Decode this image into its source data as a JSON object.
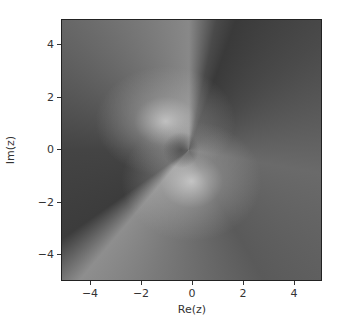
{
  "chart_data": {
    "type": "heatmap",
    "title": "",
    "xlabel": "Re(z)",
    "ylabel": "Im(z)",
    "xlim": [
      -5,
      5
    ],
    "ylim": [
      -5,
      5
    ],
    "x_ticks": [
      "-4",
      "-2",
      "0",
      "2",
      "4"
    ],
    "y_ticks": [
      "4",
      "2",
      "0",
      "-2",
      "-4"
    ],
    "colormap": "grayscale",
    "grid": false,
    "features": [
      {
        "description": "bright spot",
        "x": -0.8,
        "y": 0.8
      },
      {
        "description": "bright spot",
        "x": 0.0,
        "y": -0.8
      },
      {
        "description": "dark wedge toward upper-right"
      },
      {
        "description": "dark wedge toward lower-left"
      }
    ]
  },
  "axes": {
    "xlabel": "Re(z)",
    "ylabel": "Im(z)",
    "x_ticks": [
      {
        "label": "−4",
        "px": 90
      },
      {
        "label": "−2",
        "px": 141
      },
      {
        "label": "0",
        "px": 192
      },
      {
        "label": "2",
        "px": 243
      },
      {
        "label": "4",
        "px": 294
      }
    ],
    "y_ticks": [
      {
        "label": "4",
        "px": 44
      },
      {
        "label": "2",
        "px": 97
      },
      {
        "label": "0",
        "px": 149
      },
      {
        "label": "−2",
        "px": 202
      },
      {
        "label": "−4",
        "px": 254
      }
    ]
  }
}
